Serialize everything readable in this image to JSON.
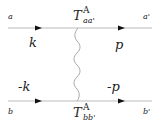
{
  "diagram": {
    "type": "feynman-diagram",
    "top_line": {
      "left_label": "a",
      "right_label": "a'",
      "incoming_momentum": "k",
      "outgoing_momentum": "p",
      "vertex_label": {
        "base": "T",
        "superscript": "A",
        "subscript": "aa'"
      }
    },
    "bottom_line": {
      "left_label": "b",
      "right_label": "b'",
      "incoming_momentum": "-k",
      "outgoing_momentum": "-p",
      "vertex_label": {
        "base": "T",
        "superscript": "A",
        "subscript": "bb'"
      }
    },
    "exchange": "wavy-gluon-line",
    "colors": {
      "line": "#bbbbbb",
      "arrow": "#111111",
      "text": "#222222"
    }
  }
}
